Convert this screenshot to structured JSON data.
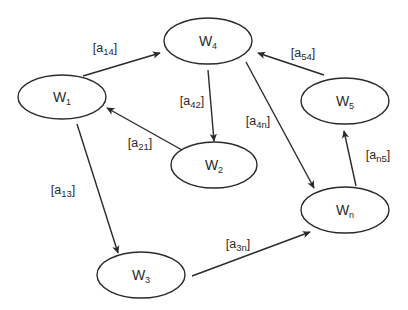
{
  "diagram": {
    "type": "directed-graph",
    "stroke_color": "#2a2a2a",
    "background": "#ffffff",
    "nodes": [
      {
        "id": "w1",
        "base": "W",
        "sub": "1",
        "cx": 62,
        "cy": 97,
        "rx": 44,
        "ry": 22
      },
      {
        "id": "w4",
        "base": "W",
        "sub": "4",
        "cx": 208,
        "cy": 41,
        "rx": 44,
        "ry": 23
      },
      {
        "id": "w5",
        "base": "W",
        "sub": "5",
        "cx": 345,
        "cy": 101,
        "rx": 44,
        "ry": 23
      },
      {
        "id": "w2",
        "base": "W",
        "sub": "2",
        "cx": 214,
        "cy": 165,
        "rx": 43,
        "ry": 23
      },
      {
        "id": "wn",
        "base": "W",
        "sub": "n",
        "cx": 345,
        "cy": 210,
        "rx": 44,
        "ry": 23
      },
      {
        "id": "w3",
        "base": "W",
        "sub": "3",
        "cx": 141,
        "cy": 275,
        "rx": 44,
        "ry": 23
      }
    ],
    "edges": [
      {
        "id": "a14",
        "from": "w1",
        "to": "w4",
        "label_base": "a",
        "label_sub": "14",
        "x1": 83,
        "y1": 76,
        "x2": 160,
        "y2": 53,
        "lx": 105,
        "ly": 48
      },
      {
        "id": "a42",
        "from": "w4",
        "to": "w2",
        "label_base": "a",
        "label_sub": "42",
        "x1": 208,
        "y1": 70,
        "x2": 214,
        "y2": 141,
        "lx": 192,
        "ly": 101
      },
      {
        "id": "a21",
        "from": "w2",
        "to": "w1",
        "label_base": "a",
        "label_sub": "21",
        "x1": 182,
        "y1": 150,
        "x2": 107,
        "y2": 108,
        "lx": 140,
        "ly": 143
      },
      {
        "id": "a54",
        "from": "w5",
        "to": "w4",
        "label_base": "a",
        "label_sub": "54",
        "x1": 324,
        "y1": 75,
        "x2": 258,
        "y2": 53,
        "lx": 303,
        "ly": 53
      },
      {
        "id": "a4n",
        "from": "w4",
        "to": "wn",
        "label_base": "a",
        "label_sub": "4n",
        "x1": 246,
        "y1": 62,
        "x2": 314,
        "y2": 188,
        "lx": 258,
        "ly": 121
      },
      {
        "id": "an5",
        "from": "wn",
        "to": "w5",
        "label_base": "a",
        "label_sub": "n5",
        "x1": 356,
        "y1": 186,
        "x2": 344,
        "y2": 131,
        "lx": 378,
        "ly": 155
      },
      {
        "id": "a13",
        "from": "w1",
        "to": "w3",
        "label_base": "a",
        "label_sub": "13",
        "x1": 77,
        "y1": 124,
        "x2": 118,
        "y2": 253,
        "lx": 63,
        "ly": 190
      },
      {
        "id": "a3n",
        "from": "w3",
        "to": "wn",
        "label_base": "a",
        "label_sub": "3n",
        "x1": 192,
        "y1": 276,
        "x2": 310,
        "y2": 232,
        "lx": 238,
        "ly": 244
      }
    ]
  }
}
